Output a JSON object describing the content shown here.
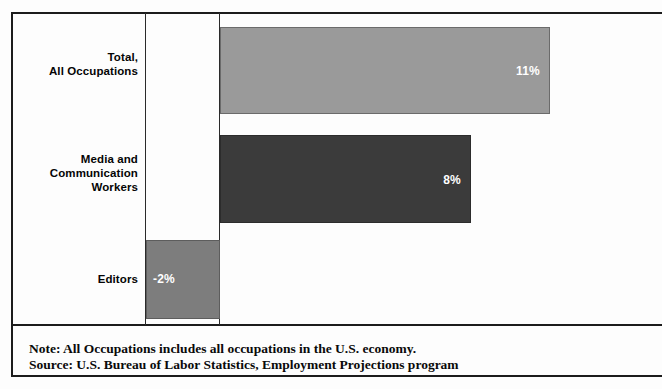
{
  "chart_data": {
    "type": "bar",
    "orientation": "horizontal",
    "title": "",
    "subtitle": "",
    "xlabel": "",
    "ylabel": "",
    "grid": false,
    "legend": null,
    "axis_baseline": 0,
    "value_suffix": "%",
    "xlim": [
      -2,
      12
    ],
    "categories": [
      "Total,\nAll Occupations",
      "Media and\nCommunication\nWorkers",
      "Editors"
    ],
    "values": [
      11,
      8,
      -2
    ],
    "data_labels": [
      "11%",
      "8%",
      "-2%"
    ],
    "bar_colors": [
      "#9a9a9a",
      "#3b3b3b",
      "#7d7d7d"
    ],
    "annotations": [
      "Note: All Occupations includes all occupations in the U.S. economy.",
      "Source: U.S. Bureau of Labor Statistics, Employment Projections program"
    ]
  },
  "chart": {
    "categories": [
      {
        "id": "total-all-occupations",
        "line1": "Total,",
        "line2": "All Occupations",
        "line3": ""
      },
      {
        "id": "media-communication-workers",
        "line1": "Media and",
        "line2": "Communication",
        "line3": "Workers"
      },
      {
        "id": "editors",
        "line1": "Editors",
        "line2": "",
        "line3": ""
      }
    ],
    "bars": [
      {
        "id": "total-all-occupations",
        "label": "11%"
      },
      {
        "id": "media-communication-workers",
        "label": "8%"
      },
      {
        "id": "editors",
        "label": "-2%"
      }
    ]
  },
  "footer": {
    "note": "Note: All Occupations includes all occupations in the U.S. economy.",
    "source": "Source: U.S. Bureau of Labor Statistics, Employment Projections program"
  },
  "colors": {
    "frame": "#1c1c1c",
    "axis": "#2a2a2a",
    "bar_light": "#9a9a9a",
    "bar_dark": "#3b3b3b",
    "bar_medium": "#7d7d7d",
    "text": "#050505",
    "value_text": "#ffffff"
  }
}
